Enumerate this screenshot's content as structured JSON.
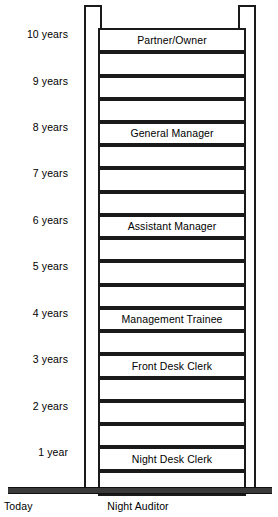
{
  "diagram": {
    "type": "career-ladder",
    "colors": {
      "line": "#1a1a1a",
      "ground": "#3a3a3a",
      "background": "#ffffff"
    },
    "year_axis": {
      "labels": [
        {
          "text": "10 years",
          "year": 10,
          "top": 28
        },
        {
          "text": "9 years",
          "year": 9,
          "top": 75
        },
        {
          "text": "8 years",
          "year": 8,
          "top": 121
        },
        {
          "text": "7 years",
          "year": 7,
          "top": 167
        },
        {
          "text": "6 years",
          "year": 6,
          "top": 214
        },
        {
          "text": "5 years",
          "year": 5,
          "top": 260
        },
        {
          "text": "4 years",
          "year": 4,
          "top": 307
        },
        {
          "text": "3 years",
          "year": 3,
          "top": 353
        },
        {
          "text": "2 years",
          "year": 2,
          "top": 400
        },
        {
          "text": "1 year",
          "year": 1,
          "top": 446
        }
      ]
    },
    "rungs": [
      {
        "index": 1,
        "label": "Partner/Owner",
        "top": 6,
        "height": 24
      },
      {
        "index": 2,
        "label": "",
        "top": 30,
        "height": 24
      },
      {
        "index": 3,
        "label": "",
        "top": 54,
        "height": 23
      },
      {
        "index": 4,
        "label": "",
        "top": 77,
        "height": 23
      },
      {
        "index": 5,
        "label": "General Manager",
        "top": 100,
        "height": 23
      },
      {
        "index": 6,
        "label": "",
        "top": 123,
        "height": 23
      },
      {
        "index": 7,
        "label": "",
        "top": 146,
        "height": 24
      },
      {
        "index": 8,
        "label": "",
        "top": 170,
        "height": 23
      },
      {
        "index": 9,
        "label": "Assistant Manager",
        "top": 193,
        "height": 23
      },
      {
        "index": 10,
        "label": "",
        "top": 216,
        "height": 23
      },
      {
        "index": 11,
        "label": "",
        "top": 239,
        "height": 24
      },
      {
        "index": 12,
        "label": "",
        "top": 263,
        "height": 23
      },
      {
        "index": 13,
        "label": "Management Trainee",
        "top": 286,
        "height": 23
      },
      {
        "index": 14,
        "label": "",
        "top": 309,
        "height": 23
      },
      {
        "index": 15,
        "label": "Front Desk Clerk",
        "top": 332,
        "height": 24
      },
      {
        "index": 16,
        "label": "",
        "top": 356,
        "height": 23
      },
      {
        "index": 17,
        "label": "",
        "top": 379,
        "height": 23
      },
      {
        "index": 18,
        "label": "",
        "top": 402,
        "height": 23
      },
      {
        "index": 19,
        "label": "Night Desk Clerk",
        "top": 425,
        "height": 24
      },
      {
        "index": 20,
        "label": "",
        "top": 449,
        "height": 25
      }
    ],
    "ground": {
      "today_label": "Today",
      "position_label": "Night Auditor"
    }
  }
}
